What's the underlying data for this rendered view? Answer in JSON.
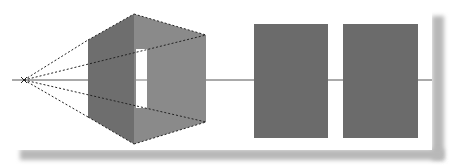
{
  "figure": {
    "colors": {
      "background": "#ffffff",
      "left_face": "#6e6e6e",
      "right_face": "#8a8a8a",
      "rect_fill": "#6b6b6b",
      "horizon": "#555555",
      "dashes": "#222222",
      "window": "#ffffff",
      "shadow": "#b8b8b8"
    },
    "vanishing_point": {
      "x": 24,
      "y": 80
    },
    "horizon_line": {
      "x1": 12,
      "x2": 432,
      "y": 80
    },
    "perspective_box": {
      "left_face": [
        [
          88,
          40
        ],
        [
          134,
          14
        ],
        [
          134,
          144
        ],
        [
          88,
          117
        ]
      ],
      "right_face": [
        [
          134,
          14
        ],
        [
          206,
          35
        ],
        [
          206,
          122
        ],
        [
          134,
          144
        ]
      ],
      "window": {
        "x": 136,
        "y": 49,
        "w": 11,
        "h": 59
      }
    },
    "rectangles": [
      {
        "x": 254,
        "y": 24,
        "w": 74,
        "h": 114
      },
      {
        "x": 343,
        "y": 24,
        "w": 75,
        "h": 114
      }
    ]
  }
}
